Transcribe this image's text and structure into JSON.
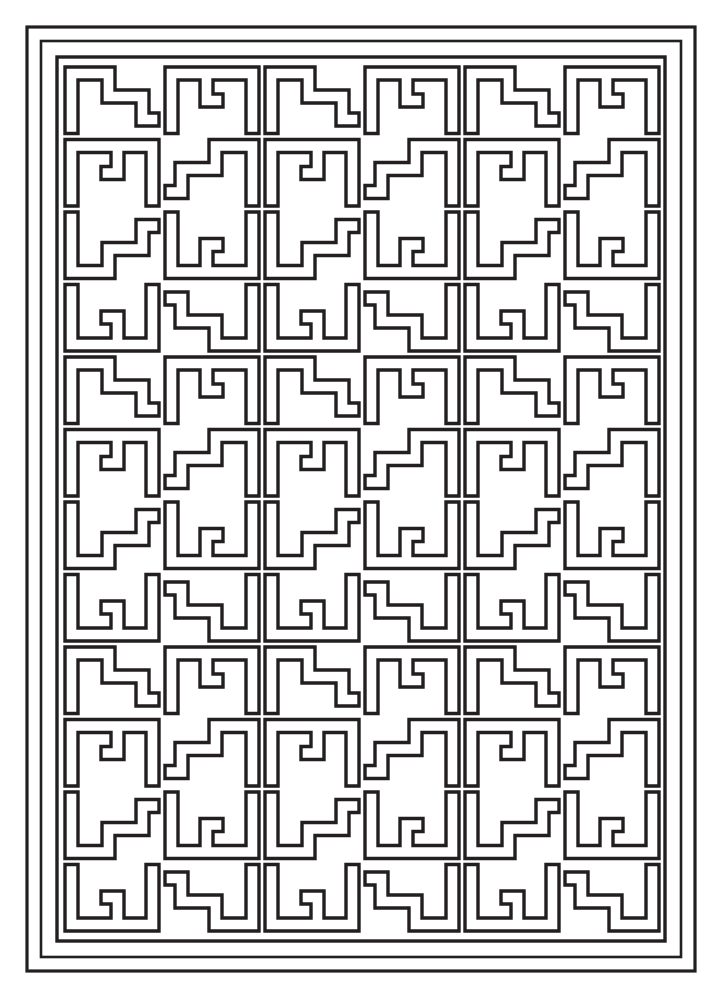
{
  "page": {
    "kind": "line-art-coloring-page",
    "width": 722,
    "height": 998,
    "background_color": "#ffffff",
    "line_color": "#231f20",
    "fill_color": "#ffffff"
  },
  "frames": {
    "description": "Three nested rectangular border rules surrounding the pattern field",
    "stroke_color": "#231f20",
    "rects": [
      {
        "name": "outer-frame",
        "x": 27,
        "y": 27,
        "width": 668,
        "height": 944,
        "stroke_width": 3.2
      },
      {
        "name": "middle-frame",
        "x": 41,
        "y": 41,
        "width": 640,
        "height": 916,
        "stroke_width": 2.6
      },
      {
        "name": "inner-frame",
        "x": 57,
        "y": 57,
        "width": 608,
        "height": 884,
        "stroke_width": 3.4
      }
    ]
  },
  "pattern": {
    "name": "interlocking-L-meander",
    "field": {
      "x": 62,
      "y": 64,
      "width": 600,
      "height": 870
    },
    "grid": {
      "block_columns": 3,
      "block_rows": 3,
      "cells_per_block_x": 2,
      "cells_per_block_y": 4,
      "total_columns": 6,
      "total_rows": 12,
      "cell_width": 100,
      "cell_height": 72.5,
      "gap": 4
    },
    "motif": {
      "type": "stepped-L-hook",
      "stroke_width": 3.4,
      "band_width": 13,
      "mirroring": "columns alternate horizontally; rows 3-4 mirror rows 1-2 vertically"
    }
  }
}
